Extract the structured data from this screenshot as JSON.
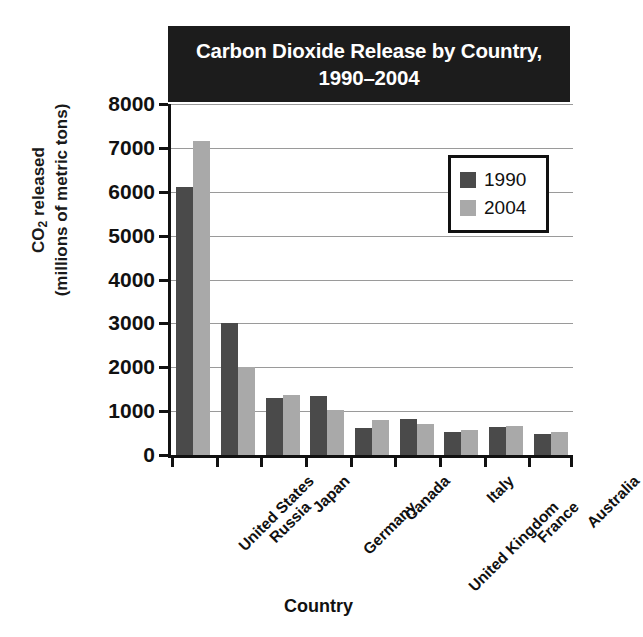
{
  "chart_data": {
    "type": "bar",
    "title": "Carbon Dioxide Release by Country, 1990–2004",
    "title_lines": [
      "Carbon Dioxide Release by Country,",
      "1990–2004"
    ],
    "xlabel": "Country",
    "ylabel": "CO2 released (millions of metric tons)",
    "ylabel_lines": [
      "CO2 released",
      "(millions of metric tons)"
    ],
    "ylim": [
      0,
      8000
    ],
    "yticks": [
      8000,
      7000,
      6000,
      5000,
      4000,
      3000,
      2000,
      1000,
      0
    ],
    "ytick_labels": [
      "8000",
      "7000",
      "6000",
      "5000",
      "4000",
      "3000",
      "2000",
      "1000",
      "0"
    ],
    "grid": true,
    "legend_position": "upper-right",
    "categories": [
      "United States",
      "Russia",
      "Japan",
      "Germany",
      "Canada",
      "United Kingdom",
      "Italy",
      "France",
      "Australia"
    ],
    "series": [
      {
        "name": "1990",
        "color": "#4a4a4a",
        "values": [
          6100,
          3000,
          1310,
          1340,
          610,
          820,
          520,
          640,
          490
        ]
      },
      {
        "name": "2004",
        "color": "#a9a9a9",
        "values": [
          7150,
          2010,
          1360,
          1030,
          800,
          700,
          580,
          660,
          530
        ]
      }
    ]
  },
  "legend": {
    "entries": [
      {
        "label": "1990",
        "swatch": "dark-gray-swatch"
      },
      {
        "label": "2004",
        "swatch": "light-gray-swatch"
      }
    ]
  },
  "colors": {
    "series_1990": "#4a4a4a",
    "series_2004": "#a9a9a9",
    "title_background": "#1c1c1c",
    "title_text": "#ffffff",
    "axis": "#111111",
    "gridline": "#9a9a9a",
    "plot_background": "#ffffff"
  }
}
